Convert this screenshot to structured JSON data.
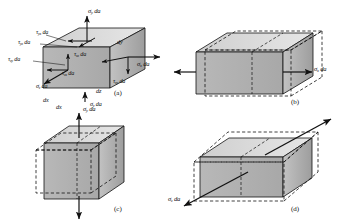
{
  "figure": {
    "type": "engineering-stress-element-diagram",
    "background": "#ffffff",
    "ink": "#111111",
    "face_light": "#d9d9d9",
    "face_mid": "#b4b4b4",
    "face_dark": "#9a9a9a",
    "panels": [
      {
        "id": "(a)",
        "caption": "(a)",
        "description": "General state of stress on a differential element",
        "labels": [
          {
            "key": "sigma_y_top",
            "text": "σ",
            "sub": "y",
            "suffix": " da"
          },
          {
            "key": "tau_yx",
            "text": "τ",
            "sub": "yx",
            "suffix": " da"
          },
          {
            "key": "tau_yz",
            "text": "τ",
            "sub": "yz",
            "suffix": " da"
          },
          {
            "key": "tau_zy",
            "text": "τ",
            "sub": "zy",
            "suffix": " da"
          },
          {
            "key": "tau_zx",
            "text": "τ",
            "sub": "zx",
            "suffix": " da"
          },
          {
            "key": "sigma_z",
            "text": "σ",
            "sub": "z",
            "suffix": " da"
          },
          {
            "key": "tau_xz",
            "text": "τ",
            "sub": "xz",
            "suffix": " da"
          },
          {
            "key": "tau_xy",
            "text": "τ",
            "sub": "xy",
            "suffix": " da"
          },
          {
            "key": "sigma_x",
            "text": "σ",
            "sub": "x",
            "suffix": " da"
          },
          {
            "key": "sigma_y_bottom",
            "text": "σ",
            "sub": "y",
            "suffix": " da"
          },
          {
            "key": "dx",
            "text": "dx",
            "sub": "",
            "suffix": ""
          },
          {
            "key": "dy",
            "text": "dy",
            "sub": "",
            "suffix": ""
          },
          {
            "key": "dz",
            "text": "dz",
            "sub": "",
            "suffix": ""
          }
        ]
      },
      {
        "id": "(b)",
        "caption": "(b)",
        "description": "Deformation due to normal stress in the x direction",
        "labels": [
          {
            "key": "sigma_x",
            "text": "σ",
            "sub": "x",
            "suffix": " da"
          }
        ]
      },
      {
        "id": "(c)",
        "caption": "(c)",
        "description": "Deformation due to normal stress in the y direction",
        "labels": [
          {
            "key": "dx",
            "text": "dx",
            "sub": "",
            "suffix": ""
          },
          {
            "key": "sigma_y",
            "text": "σ",
            "sub": "y",
            "suffix": " da"
          }
        ]
      },
      {
        "id": "(d)",
        "caption": "(d)",
        "description": "Deformation due to normal stress in the z direction",
        "labels": [
          {
            "key": "sigma_z",
            "text": "σ",
            "sub": "z",
            "suffix": " da"
          }
        ]
      }
    ]
  },
  "labels": {
    "a": {
      "sigma_y_top": {
        "sym": "σ",
        "sub": "y",
        "tail": " da"
      },
      "tau_yx": {
        "sym": "τ",
        "sub": "yx",
        "tail": " da"
      },
      "tau_yz": {
        "sym": "τ",
        "sub": "yz",
        "tail": " da"
      },
      "tau_zy": {
        "sym": "τ",
        "sub": "zy",
        "tail": " da"
      },
      "tau_zx": {
        "sym": "τ",
        "sub": "zx",
        "tail": " da"
      },
      "sigma_z": {
        "sym": "σ",
        "sub": "z",
        "tail": " da"
      },
      "tau_xz": {
        "sym": "τ",
        "sub": "xz",
        "tail": " da"
      },
      "tau_xy": {
        "sym": "τ",
        "sub": "xy",
        "tail": " da"
      },
      "sigma_x": {
        "sym": "σ",
        "sub": "x",
        "tail": " da"
      },
      "sigma_y_bottom": {
        "sym": "σ",
        "sub": "y",
        "tail": " da"
      },
      "dx": {
        "sym": "dx",
        "sub": "",
        "tail": ""
      },
      "dy": {
        "sym": "dy",
        "sub": "",
        "tail": ""
      },
      "dz": {
        "sym": "dz",
        "sub": "",
        "tail": ""
      },
      "caption": "(a)"
    },
    "b": {
      "sigma_x": {
        "sym": "σ",
        "sub": "x",
        "tail": " da"
      },
      "caption": "(b)"
    },
    "c": {
      "dx": {
        "sym": "dx",
        "sub": "",
        "tail": ""
      },
      "sigma_y": {
        "sym": "σ",
        "sub": "y",
        "tail": " da"
      },
      "caption": "(c)"
    },
    "d": {
      "sigma_z": {
        "sym": "σ",
        "sub": "z",
        "tail": " da"
      },
      "caption": "(d)"
    }
  }
}
